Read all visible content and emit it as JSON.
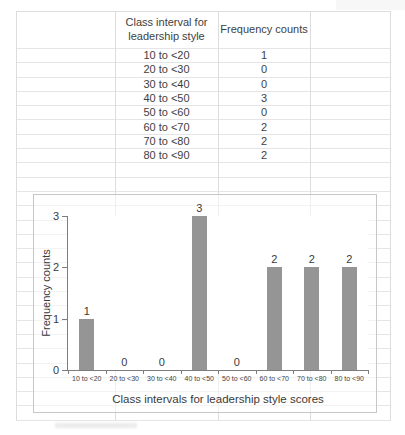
{
  "table": {
    "headers": [
      "Class interval for leadership style",
      "Frequency counts"
    ],
    "rows": [
      {
        "interval": "10 to <20",
        "count": "1"
      },
      {
        "interval": "20 to <30",
        "count": "0"
      },
      {
        "interval": "30 to <40",
        "count": "0"
      },
      {
        "interval": "40 to <50",
        "count": "3"
      },
      {
        "interval": "50 to <60",
        "count": "0"
      },
      {
        "interval": "60 to <70",
        "count": "2"
      },
      {
        "interval": "70 to <80",
        "count": "2"
      },
      {
        "interval": "80 to <90",
        "count": "2"
      }
    ]
  },
  "chart_data": {
    "type": "bar",
    "title": "",
    "categories": [
      "10 to <20",
      "20 to <30",
      "30 to <40",
      "40 to <50",
      "50 to <60",
      "60 to <70",
      "70 to <80",
      "80 to <90"
    ],
    "values": [
      1,
      0,
      0,
      3,
      0,
      2,
      2,
      2
    ],
    "data_labels": [
      "1",
      "0",
      "0",
      "3",
      "0",
      "2",
      "2",
      "2"
    ],
    "xlabel": "Class intervals for leadership style scores",
    "ylabel": "Frequency counts",
    "ylim": [
      0,
      3
    ],
    "yticks": [
      0,
      1,
      2,
      3
    ],
    "grid": false,
    "legend": false,
    "bar_color": "#959595"
  },
  "colors": {
    "bar": "#959595",
    "axis": "#7d7d7d",
    "sheet_gridline": "#e5e5e7",
    "chart_border": "#c7c7c9",
    "text": "#3e3e3e"
  }
}
